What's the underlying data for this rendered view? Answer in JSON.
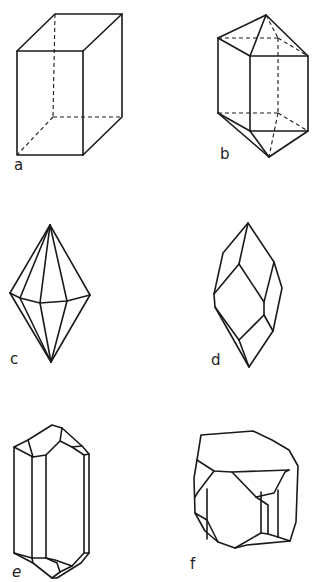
{
  "header": {
    "text": "INTRODUCTION TO MINERALS"
  },
  "figures": [
    {
      "id": "a",
      "label": "a",
      "description": "prism (orthorhombic/tetragonal box) with hidden edges dashed"
    },
    {
      "id": "b",
      "label": "b",
      "description": "prism with pyramidal terminations, hidden edges dashed"
    },
    {
      "id": "c",
      "label": "c",
      "description": "hexagonal dipyramid"
    },
    {
      "id": "d",
      "label": "d",
      "description": "rhombohedral/scalenohedral crystal form"
    },
    {
      "id": "e",
      "label": "e",
      "description": "elongated prism with terminal faces (quartz-like)"
    },
    {
      "id": "f",
      "label": "f",
      "description": "cube modified by octahedron and dodecahedron faces"
    }
  ],
  "colors": {
    "line": "#1a1a1a",
    "background": "#ffffff"
  }
}
